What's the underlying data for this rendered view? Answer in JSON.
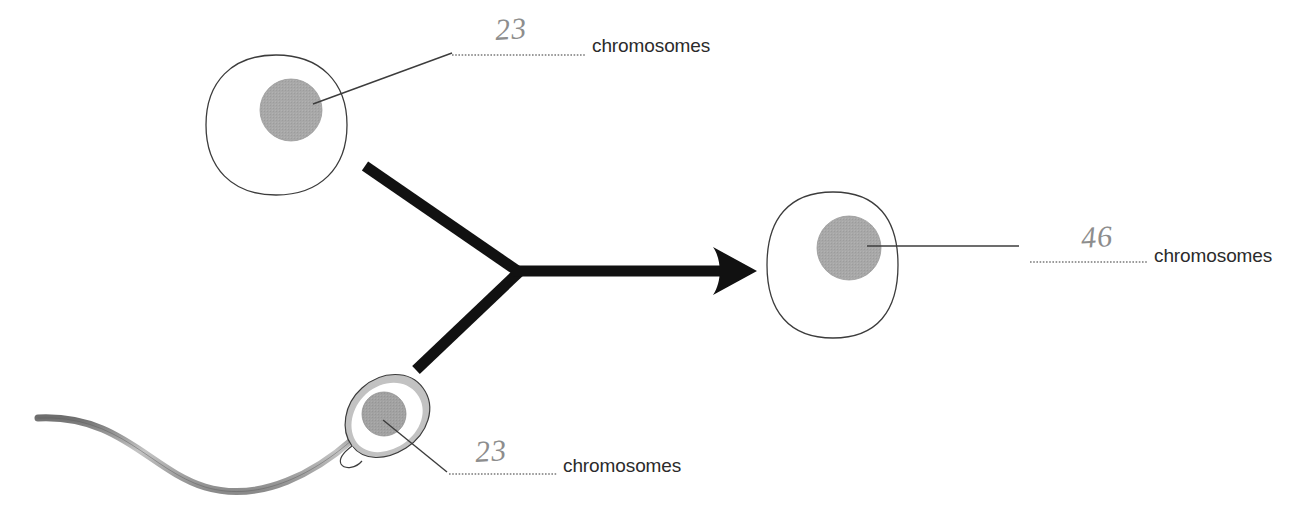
{
  "diagram": {
    "background_color": "#ffffff",
    "cells": [
      {
        "id": "egg",
        "name": "egg-cell",
        "nucleus_color": "#a8a8a8",
        "outline_color": "#3c3c3c"
      },
      {
        "id": "sperm",
        "name": "sperm-cell",
        "nucleus_color": "#a0a0a0",
        "membrane_color": "#bdbdbd",
        "outline_color": "#3c3c3c"
      },
      {
        "id": "zygote",
        "name": "zygote-cell",
        "nucleus_color": "#a8a8a8",
        "outline_color": "#3c3c3c"
      }
    ],
    "labels": [
      {
        "id": "top",
        "value": "23",
        "text": "chromosomes",
        "refers_to": "egg-cell-nucleus"
      },
      {
        "id": "bottom",
        "value": "23",
        "text": "chromosomes",
        "refers_to": "sperm-cell-nucleus"
      },
      {
        "id": "right",
        "value": "46",
        "text": "chromosomes",
        "refers_to": "zygote-cell-nucleus"
      }
    ],
    "arrow": {
      "name": "fertilization-arrow",
      "color": "#111111",
      "description": "two branches merging into one arrow pointing right"
    }
  }
}
